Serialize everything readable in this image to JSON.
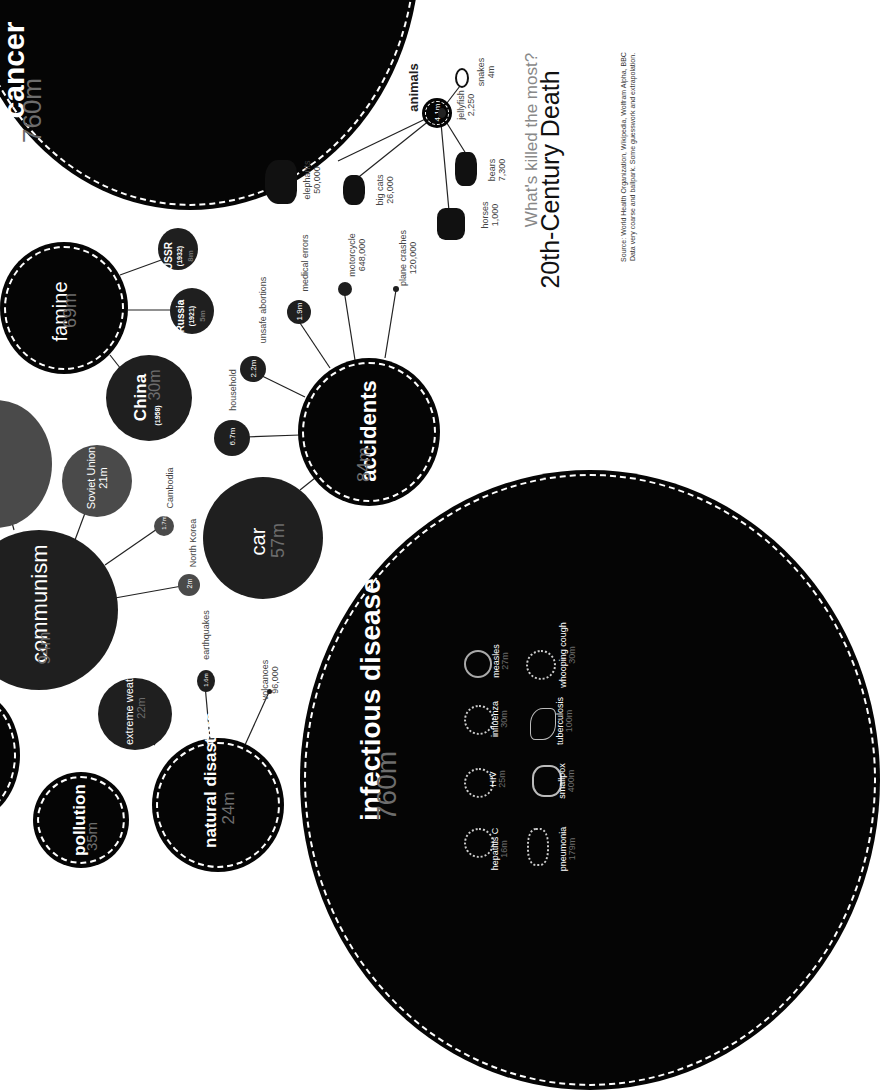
{
  "title": "20th-Century Death",
  "subtitle": "What's killed the most?",
  "source_line1": "Source: World Health Organization, Wikipedia, Wolfram Alpha, BBC",
  "source_line2": "Data very coarse and ballpark. Some guesswork and extrapolation.",
  "categories": {
    "cancer": {
      "label": "cancer",
      "value": "760m"
    },
    "infectious_disease": {
      "label": "infectious disease",
      "value": "760m"
    },
    "communism": {
      "label": "communism",
      "value": "94m"
    },
    "accidents": {
      "label": "accidents",
      "value": "84m"
    },
    "famine": {
      "label": "famine",
      "value": "69m"
    },
    "car": {
      "label": "car",
      "value": "57m"
    },
    "pollution": {
      "label": "pollution",
      "value": "35m"
    },
    "natural_disasters": {
      "label": "natural disasters",
      "value": "24m"
    },
    "extreme_weather": {
      "label": "extreme weather",
      "value": "22m"
    },
    "animals": {
      "label": "animals",
      "value": "4.1m"
    }
  },
  "famine_children": [
    {
      "label": "China",
      "year": "(1958)",
      "value": "30m"
    },
    {
      "label": "Russia",
      "year": "(1921)",
      "value": "5m"
    },
    {
      "label": "USSR",
      "year": "(1932)",
      "value": "8m"
    }
  ],
  "communism_children": [
    {
      "label": "Soviet Union",
      "value": "21m"
    },
    {
      "label": "Cambodia",
      "value": "1.7m"
    },
    {
      "label": "North Korea",
      "value": "2m"
    }
  ],
  "accident_children": [
    {
      "label": "household",
      "value": "6.7m"
    },
    {
      "label": "unsafe abortions",
      "value": "2.2m"
    },
    {
      "label": "medical errors",
      "value": "1.9m"
    },
    {
      "label": "motorcycle",
      "value": "648,000"
    },
    {
      "label": "plane crashes",
      "value": "120,000"
    }
  ],
  "disaster_children": [
    {
      "label": "earthquakes",
      "value": "1.6m"
    },
    {
      "label": "volcanoes",
      "value": "96,000"
    }
  ],
  "animal_children": [
    {
      "label": "elephants",
      "value": "50,000"
    },
    {
      "label": "big cats",
      "value": "26,000"
    },
    {
      "label": "horses",
      "value": "1,000"
    },
    {
      "label": "bears",
      "value": "7,300"
    },
    {
      "label": "jellyfish",
      "value": "2,250"
    },
    {
      "label": "snakes",
      "value": "4m"
    }
  ],
  "diseases": [
    {
      "label": "hepatitis C",
      "value": "16m"
    },
    {
      "label": "HIV",
      "value": "25m"
    },
    {
      "label": "influenza",
      "value": "30m"
    },
    {
      "label": "measles",
      "value": "27m"
    },
    {
      "label": "pneumonia",
      "value": "179m"
    },
    {
      "label": "smallpox",
      "value": "400m"
    },
    {
      "label": "tuberculosis",
      "value": "100m"
    },
    {
      "label": "whooping cough",
      "value": "30m"
    }
  ]
}
